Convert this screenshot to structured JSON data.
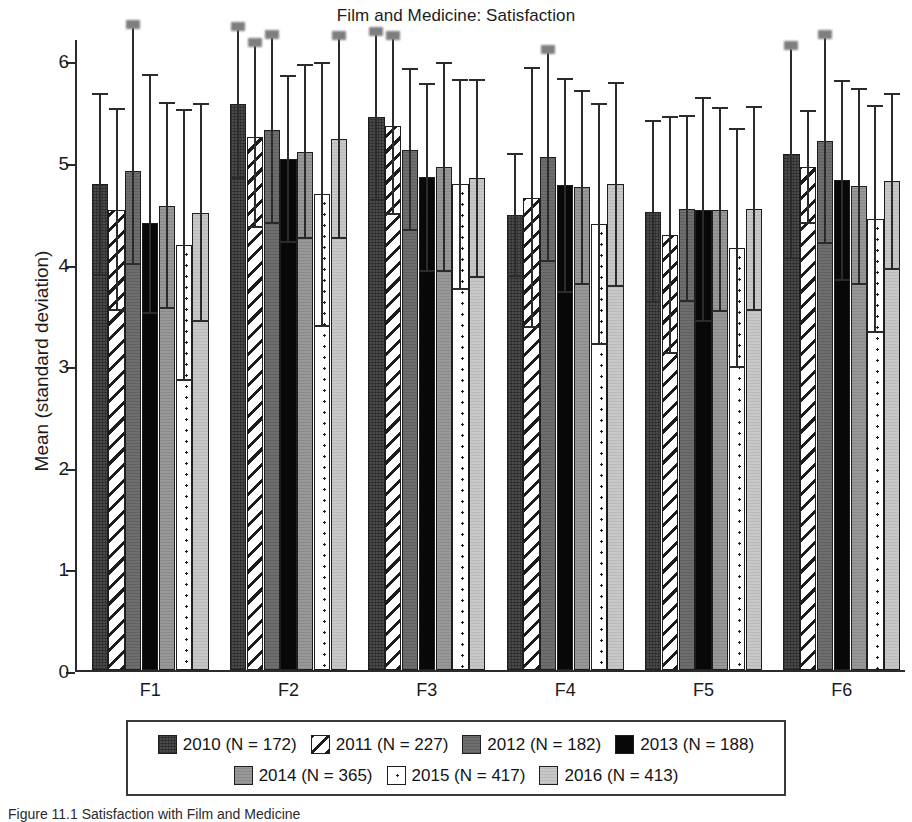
{
  "chart_data": {
    "type": "bar",
    "title": "Film and Medicine: Satisfaction",
    "xlabel": "",
    "ylabel": "Mean (standard deviation)",
    "ylim": [
      0,
      6.2
    ],
    "yticks": [
      0,
      1,
      2,
      3,
      4,
      5,
      6
    ],
    "grid": false,
    "legend_position": "bottom",
    "orientation": "vertical",
    "error_bars": "standard deviation",
    "categories": [
      "F1",
      "F2",
      "F3",
      "F4",
      "F5",
      "F6"
    ],
    "series": [
      {
        "name": "2010 (N = 172)",
        "year": "2010",
        "n": 172,
        "pattern": "solid-dark-gray",
        "color": "#4a4a4a",
        "values": [
          4.78,
          5.57,
          5.44,
          4.48,
          4.51,
          5.08
        ],
        "err_low": [
          3.89,
          4.84,
          4.63,
          3.88,
          3.62,
          4.05
        ],
        "err_high": [
          5.67,
          6.3,
          6.25,
          5.08,
          5.4,
          6.11
        ]
      },
      {
        "name": "2011 (N = 227)",
        "year": "2011",
        "n": 227,
        "pattern": "diagonal-hatch",
        "color": "#ffffff",
        "values": [
          4.53,
          5.25,
          5.35,
          4.65,
          4.28,
          4.95
        ],
        "err_low": [
          3.54,
          4.36,
          4.49,
          3.38,
          3.12,
          4.4
        ],
        "err_high": [
          5.52,
          6.14,
          6.21,
          5.92,
          5.44,
          5.5
        ]
      },
      {
        "name": "2012 (N = 182)",
        "year": "2012",
        "n": 182,
        "pattern": "medium-dark-gray",
        "color": "#6e6e6e",
        "values": [
          4.91,
          5.31,
          5.12,
          5.05,
          4.54,
          5.21
        ],
        "err_low": [
          4.0,
          4.4,
          4.33,
          4.03,
          3.63,
          4.2
        ],
        "err_high": [
          6.32,
          6.22,
          5.91,
          6.07,
          5.45,
          6.22
        ]
      },
      {
        "name": "2013 (N = 188)",
        "year": "2013",
        "n": 188,
        "pattern": "solid-black",
        "color": "#080808",
        "values": [
          4.4,
          5.03,
          4.85,
          4.77,
          4.53,
          4.82
        ],
        "err_low": [
          3.51,
          4.21,
          3.93,
          3.72,
          3.43,
          3.84
        ],
        "err_high": [
          5.86,
          5.85,
          5.77,
          5.82,
          5.63,
          5.8
        ]
      },
      {
        "name": "2014 (N = 365)",
        "year": "2014",
        "n": 365,
        "pattern": "medium-gray",
        "color": "#989898",
        "values": [
          4.57,
          5.1,
          4.95,
          4.75,
          4.53,
          4.76
        ],
        "err_low": [
          3.56,
          4.25,
          3.93,
          3.8,
          3.53,
          3.8
        ],
        "err_high": [
          5.58,
          5.95,
          5.97,
          5.7,
          5.53,
          5.72
        ]
      },
      {
        "name": "2015 (N = 417)",
        "year": "2015",
        "n": 417,
        "pattern": "white-dotted",
        "color": "#ffffff",
        "values": [
          4.18,
          4.68,
          4.78,
          4.39,
          4.15,
          4.44
        ],
        "err_low": [
          2.85,
          3.39,
          3.75,
          3.21,
          2.98,
          3.33
        ],
        "err_high": [
          5.51,
          5.97,
          5.81,
          5.57,
          5.32,
          5.55
        ]
      },
      {
        "name": "2016 (N = 413)",
        "year": "2016",
        "n": 413,
        "pattern": "light-gray",
        "color": "#c8c8c8",
        "values": [
          4.5,
          5.23,
          4.84,
          4.78,
          4.54,
          4.81
        ],
        "err_low": [
          3.43,
          4.25,
          3.87,
          3.78,
          3.54,
          3.95
        ],
        "err_high": [
          5.57,
          6.21,
          5.81,
          5.78,
          5.54,
          5.67
        ]
      }
    ]
  },
  "legend": {
    "items": [
      {
        "label": "2010 (N = 172)",
        "pattern": "p-2010"
      },
      {
        "label": "2011 (N = 227)",
        "pattern": "p-2011"
      },
      {
        "label": "2012 (N = 182)",
        "pattern": "p-2012"
      },
      {
        "label": "2013 (N = 188)",
        "pattern": "p-2013"
      },
      {
        "label": "2014 (N = 365)",
        "pattern": "p-2014"
      },
      {
        "label": "2015 (N = 417)",
        "pattern": "p-2015"
      },
      {
        "label": "2016 (N = 413)",
        "pattern": "p-2016"
      }
    ]
  },
  "caption": "Figure 11.1  Satisfaction with Film and Medicine"
}
